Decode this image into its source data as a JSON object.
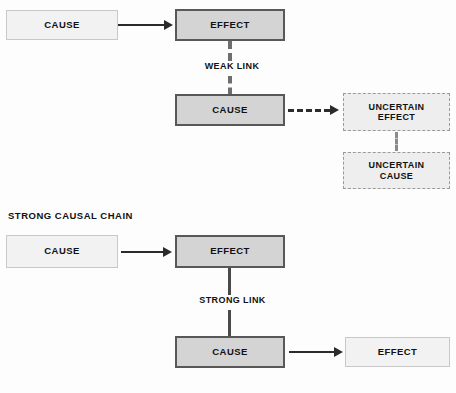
{
  "diagram": {
    "title_visible": false,
    "sections": [
      {
        "id": "weak",
        "heading": "",
        "nodes": [
          {
            "id": "weak-cause-1",
            "label": "CAUSE",
            "style": "light"
          },
          {
            "id": "weak-effect-1",
            "label": "EFFECT",
            "style": "strong"
          },
          {
            "id": "weak-cause-2",
            "label": "CAUSE",
            "style": "strong"
          },
          {
            "id": "uncertain-effect",
            "label": "UNCERTAIN\nEFFECT",
            "style": "uncertain"
          },
          {
            "id": "uncertain-cause",
            "label": "UNCERTAIN\nCAUSE",
            "style": "uncertain"
          }
        ],
        "link_caption": "WEAK LINK"
      },
      {
        "id": "strong",
        "heading": "STRONG CAUSAL CHAIN",
        "nodes": [
          {
            "id": "strong-cause-1",
            "label": "CAUSE",
            "style": "light"
          },
          {
            "id": "strong-effect-1",
            "label": "EFFECT",
            "style": "strong"
          },
          {
            "id": "strong-cause-2",
            "label": "CAUSE",
            "style": "strong"
          },
          {
            "id": "strong-effect-2",
            "label": "EFFECT",
            "style": "light"
          }
        ],
        "link_caption": "STRONG LINK"
      }
    ]
  },
  "labels": {
    "weak_cause_1": "CAUSE",
    "weak_effect_1": "EFFECT",
    "weak_link": "WEAK LINK",
    "weak_cause_2": "CAUSE",
    "uncertain_effect": "UNCERTAIN\nEFFECT",
    "uncertain_cause": "UNCERTAIN\nCAUSE",
    "strong_section_heading": "STRONG CAUSAL CHAIN",
    "strong_cause_1": "CAUSE",
    "strong_effect_1": "EFFECT",
    "strong_link": "STRONG LINK",
    "strong_cause_2": "CAUSE",
    "strong_effect_2": "EFFECT"
  },
  "colors": {
    "background": "#fdfdfd",
    "strong_node_fill": "#d4d4d4",
    "strong_node_border": "#585858",
    "light_node_fill": "#f2f2f2",
    "light_node_border": "#c8c8c8",
    "uncertain_node_fill": "#eeeeee",
    "uncertain_node_border": "#9a9a9a",
    "arrow": "#2b2b2b",
    "text": "#111111"
  }
}
